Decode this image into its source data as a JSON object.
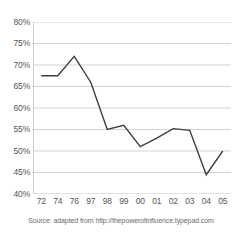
{
  "chart_data": {
    "type": "line",
    "title": "",
    "subtitle": "",
    "xlabel": "",
    "ylabel": "",
    "categories": [
      "72",
      "74",
      "76",
      "97",
      "98",
      "99",
      "00",
      "01",
      "02",
      "03",
      "04",
      "05"
    ],
    "values": [
      67.5,
      67.5,
      72.0,
      66.0,
      55.0,
      56.0,
      51.0,
      53.0,
      55.2,
      54.8,
      44.5,
      50.0
    ],
    "series": [
      {
        "name": "",
        "values": [
          67.5,
          67.5,
          72.0,
          66.0,
          55.0,
          56.0,
          51.0,
          53.0,
          55.2,
          54.8,
          44.5,
          50.0
        ]
      }
    ],
    "ylim": [
      40,
      80
    ],
    "ytick_values": [
      40,
      45,
      50,
      55,
      60,
      65,
      70,
      75,
      80
    ],
    "ytick_labels": [
      "40%",
      "45%",
      "50%",
      "55%",
      "60%",
      "65%",
      "70%",
      "75%",
      "80%"
    ],
    "xtick_labels": [
      "72",
      "74",
      "76",
      "97",
      "98",
      "99",
      "00",
      "01",
      "02",
      "03",
      "04",
      "05"
    ],
    "grid": "horizontal",
    "legend": "none",
    "line_color": "#3d3d3d",
    "grid_color": "#bfbfbf",
    "axis_color": "#9a9a9a",
    "background_color": "#ffffff",
    "annotations": []
  },
  "source": {
    "text": "Source: adapted from http://thepowerofinfluence.typepad.com"
  }
}
